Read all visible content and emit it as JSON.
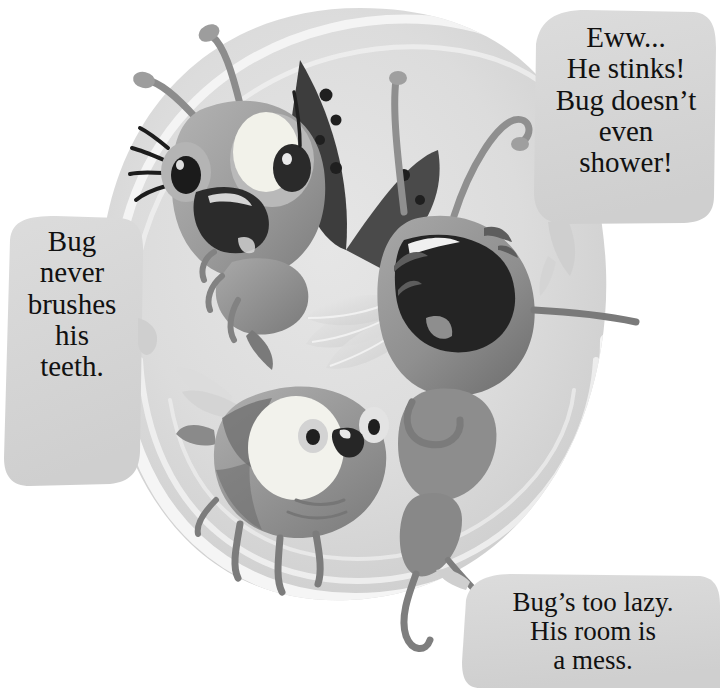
{
  "scene": {
    "title": "Bug teasing scene",
    "media": "children's book illustration",
    "palette": {
      "page_background": "#ffffff",
      "bubble_fill": "#d5d5d5",
      "bubble_fill_light": "#e0e0e0",
      "backdrop_blob": "#dcdcdc",
      "backdrop_swirl": "#f4f4f4",
      "ink_dark": "#3a3a3a",
      "body_mid": "#9a9a9a",
      "body_light": "#c9c9c9",
      "text": "#111111"
    }
  },
  "bubbles": [
    {
      "id": "left",
      "name": "bubble-left",
      "text": "Bug\nnever\nbrushes\nhis\nteeth.",
      "speaker": "bee"
    },
    {
      "id": "topright",
      "name": "bubble-topright",
      "text": "Eww...\nHe stinks!\nBug doesn’t\neven\nshower!",
      "speaker": "ladybug"
    },
    {
      "id": "bottom",
      "name": "bubble-bottom",
      "text": "Bug’s too lazy.\nHis room is\na mess.",
      "speaker": "mantis"
    }
  ],
  "characters": [
    {
      "id": "ladybug",
      "label": "ladybug",
      "description": "winged ladybug with eyelashes, wide eyes and open mouth"
    },
    {
      "id": "mantis",
      "label": "mantis",
      "description": "laughing mantis with wide open mouth and closed eyes"
    },
    {
      "id": "bee",
      "label": "bee",
      "description": "striped bee with large round eyes and small open mouth"
    }
  ]
}
